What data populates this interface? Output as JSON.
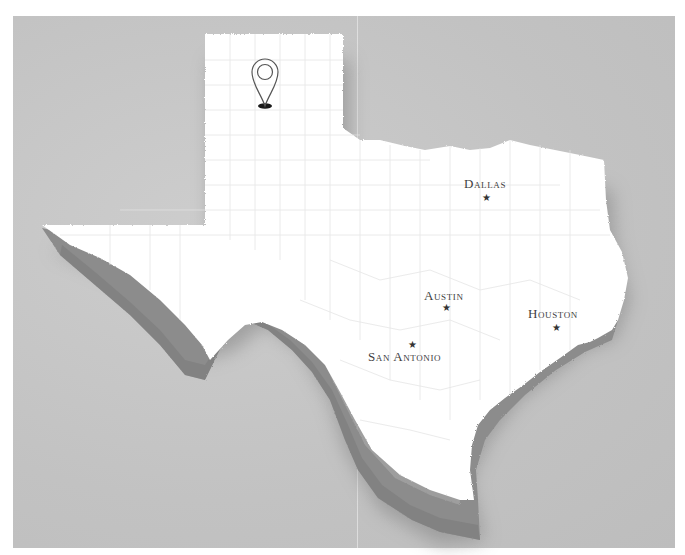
{
  "map": {
    "region": "Texas",
    "style": "3D extruded white state on gray background with county lines",
    "colors": {
      "background": "#c4c4c4",
      "land": "#ffffff",
      "extrusion": "#8e8e8e",
      "shadow": "#9a9a9a",
      "county_lines": "#e3e3e3",
      "label": "#3e3e3e"
    },
    "marker": {
      "icon": "location-pin-icon",
      "position": "Texas Panhandle"
    },
    "cities": [
      {
        "name": "Dallas",
        "label": "Dallas"
      },
      {
        "name": "Austin",
        "label": "Austin"
      },
      {
        "name": "Houston",
        "label": "Houston"
      },
      {
        "name": "San Antonio",
        "label": "San Antonio"
      }
    ]
  }
}
